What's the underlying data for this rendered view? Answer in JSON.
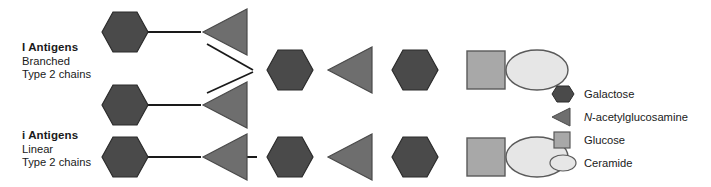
{
  "figure": {
    "colors": {
      "galactose_fill": "#4a4a4a",
      "galactose_stroke": "#2b2b2b",
      "glcnac_fill": "#6e6e6e",
      "glcnac_stroke": "#4a4a4a",
      "glucose_fill": "#a8a8a8",
      "glucose_stroke": "#5a5a5a",
      "ceramide_fill": "#e6e6e6",
      "ceramide_stroke": "#5a5a5a",
      "bond_stroke": "#1a1a1a",
      "text": "#1a1a1a",
      "background": "#ffffff"
    },
    "labels": [
      {
        "id": "i-antigens-upper",
        "title": "I Antigens",
        "line1": "Branched",
        "line2": "Type 2 chains"
      },
      {
        "id": "i-antigens-lower",
        "title": "i Antigens",
        "line1": "Linear",
        "line2": "Type 2 chains"
      }
    ],
    "legend": [
      {
        "id": "galactose",
        "shape": "hexagon",
        "label": "Galactose",
        "italic_prefix": ""
      },
      {
        "id": "n-acetylglucosamine",
        "shape": "triangle",
        "label": "-acetylglucosamine",
        "italic_prefix": "N"
      },
      {
        "id": "glucose",
        "shape": "square",
        "label": "Glucose",
        "italic_prefix": ""
      },
      {
        "id": "ceramide",
        "shape": "ellipse",
        "label": "Ceramide",
        "italic_prefix": ""
      }
    ],
    "structures": [
      {
        "id": "branched-type-2",
        "type": "branched",
        "branches": [
          {
            "id": "upper-branch",
            "units": [
              "galactose",
              "n-acetylglucosamine"
            ]
          },
          {
            "id": "lower-branch",
            "units": [
              "galactose",
              "n-acetylglucosamine"
            ]
          }
        ],
        "backbone": [
          "galactose",
          "n-acetylglucosamine",
          "galactose",
          "glucose",
          "ceramide"
        ]
      },
      {
        "id": "linear-type-2",
        "type": "linear",
        "backbone": [
          "galactose",
          "n-acetylglucosamine",
          "galactose",
          "n-acetylglucosamine",
          "galactose",
          "glucose",
          "ceramide"
        ]
      }
    ]
  }
}
